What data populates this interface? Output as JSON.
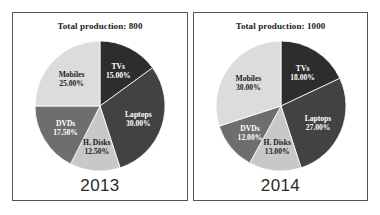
{
  "chart_data": [
    {
      "type": "pie",
      "title": "Total production: 800",
      "year": "2013",
      "total": 800,
      "unit": "percent",
      "start_angle_deg": 0,
      "direction": "clockwise",
      "categories": [
        "TVs",
        "Laptops",
        "H. Disks",
        "DVDs",
        "Mobiles"
      ],
      "values": [
        15.0,
        30.0,
        12.5,
        17.5,
        25.0
      ],
      "value_labels": [
        "15.00%",
        "30.00%",
        "12.50%",
        "17.50%",
        "25.00%"
      ],
      "colors": [
        "#2d2d2d",
        "#424242",
        "#c8c8c8",
        "#6e6e6e",
        "#dcdcdc"
      ],
      "label_text_colors": [
        "#ffffff",
        "#ffffff",
        "#1b1b1b",
        "#ffffff",
        "#1b1b1b"
      ],
      "legend": "none",
      "grid": false
    },
    {
      "type": "pie",
      "title": "Total production: 1000",
      "year": "2014",
      "total": 1000,
      "unit": "percent",
      "start_angle_deg": 0,
      "direction": "clockwise",
      "categories": [
        "TVs",
        "Laptops",
        "H. Disks",
        "DVDs",
        "Mobiles"
      ],
      "values": [
        18.0,
        27.0,
        13.0,
        12.0,
        30.0
      ],
      "value_labels": [
        "18.00%",
        "27.00%",
        "13.00%",
        "12.00%",
        "30.00%"
      ],
      "colors": [
        "#2d2d2d",
        "#424242",
        "#c8c8c8",
        "#6e6e6e",
        "#dcdcdc"
      ],
      "label_text_colors": [
        "#ffffff",
        "#ffffff",
        "#1b1b1b",
        "#ffffff",
        "#1b1b1b"
      ],
      "legend": "none",
      "grid": false
    }
  ],
  "panels": [
    {
      "title": "Total production: 800",
      "year": "2013"
    },
    {
      "title": "Total production: 1000",
      "year": "2014"
    }
  ]
}
